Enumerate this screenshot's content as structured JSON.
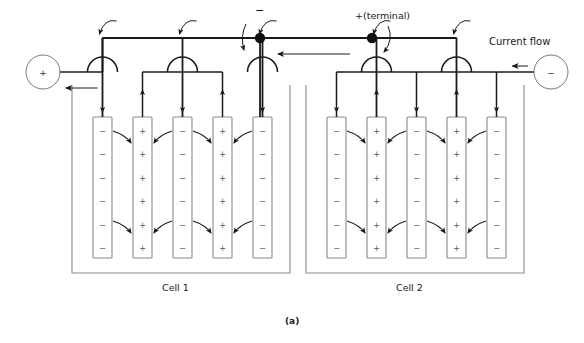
{
  "figure": {
    "caption": "(a)",
    "type": "lead-acid battery cell connection schematic"
  },
  "labels": {
    "negative_terminal": "−",
    "positive_terminal": "+(terminal)",
    "current_flow": "Current flow",
    "cell1": "Cell 1",
    "cell2": "Cell 2",
    "left_circle_sign": "+",
    "right_circle_sign": "−"
  },
  "colors": {
    "line": "#1a1a1a",
    "plate_stroke": "#8a8a8a",
    "container_stroke": "#8a8a8a",
    "text": "#1a1a1a",
    "background": "#ffffff"
  },
  "cells": [
    {
      "name": "Cell 1",
      "plates": [
        {
          "index": 1,
          "polarity": "−",
          "symbols": [
            "−",
            "−",
            "−",
            "−",
            "−",
            "−"
          ],
          "bus": "top"
        },
        {
          "index": 2,
          "polarity": "+",
          "symbols": [
            "+",
            "+",
            "+",
            "+",
            "+",
            "+"
          ],
          "bus": "lower"
        },
        {
          "index": 3,
          "polarity": "−",
          "symbols": [
            "−",
            "−",
            "−",
            "−",
            "−",
            "−"
          ],
          "bus": "top"
        },
        {
          "index": 4,
          "polarity": "+",
          "symbols": [
            "+",
            "+",
            "+",
            "+",
            "+",
            "+"
          ],
          "bus": "lower"
        },
        {
          "index": 5,
          "polarity": "−",
          "symbols": [
            "−",
            "−",
            "−",
            "−",
            "−",
            "−"
          ],
          "bus": "top"
        }
      ],
      "drop_arrows": [
        "down",
        "up",
        "down",
        "up",
        "down"
      ]
    },
    {
      "name": "Cell 2",
      "plates": [
        {
          "index": 1,
          "polarity": "−",
          "symbols": [
            "−",
            "−",
            "−",
            "−",
            "−",
            "−"
          ],
          "bus": "lower"
        },
        {
          "index": 2,
          "polarity": "+",
          "symbols": [
            "+",
            "+",
            "+",
            "+",
            "+",
            "+"
          ],
          "bus": "top"
        },
        {
          "index": 3,
          "polarity": "−",
          "symbols": [
            "−",
            "−",
            "−",
            "−",
            "−",
            "−"
          ],
          "bus": "lower"
        },
        {
          "index": 4,
          "polarity": "+",
          "symbols": [
            "+",
            "+",
            "+",
            "+",
            "+",
            "+"
          ],
          "bus": "top"
        },
        {
          "index": 5,
          "polarity": "−",
          "symbols": [
            "−",
            "−",
            "−",
            "−",
            "−",
            "−"
          ],
          "bus": "lower"
        }
      ],
      "drop_arrows": [
        "down",
        "up",
        "down",
        "up",
        "down"
      ]
    }
  ],
  "geometry": {
    "cell1_plate_x": [
      93,
      133,
      173,
      213,
      253
    ],
    "cell2_plate_x": [
      327,
      367,
      407,
      447,
      487
    ],
    "plate_width": 19,
    "plate_top": 117,
    "plate_bottom": 258,
    "top_rail_y": 38,
    "lower_bus_y": 72,
    "cell1_container": {
      "x": 72,
      "y": 85,
      "w": 218,
      "h": 188
    },
    "cell2_container": {
      "x": 306,
      "y": 85,
      "w": 218,
      "h": 188
    },
    "terminal_dots": [
      {
        "x": 260,
        "y": 38
      },
      {
        "x": 372,
        "y": 38
      }
    ],
    "left_circle": {
      "cx": 43,
      "cy": 72,
      "r": 17
    },
    "right_circle": {
      "cx": 551,
      "cy": 72,
      "r": 17
    }
  }
}
